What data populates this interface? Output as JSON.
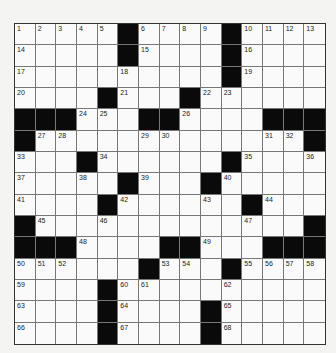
{
  "puzzle": {
    "rows": 15,
    "cols": 15,
    "colors": {
      "black": "#0a0a0a",
      "white": "#fafafa",
      "line": "#777777"
    },
    "grid": [
      "1,2,3,4,5,#,6,7,8,9,#,10,11,12,13",
      "14,.,.,.,.,#,15,.,.,.,#,16,.,.,.",
      "17,.,.,.,.,18,.,.,.,.,#,19,.,.,.",
      "20,.,.,.,#,21,.,.,#,22,23,.,.,.,.",
      "#,#,#,24,25,.,#,#,26,.,.,.,#,#,#",
      "#,27,28,.,.,.,29,30,.,.,.,.,31,32,#",
      "33,.,.,#,34,.,.,.,.,.,#,35,.,.,36",
      "37,.,.,38,.,#,39,.,.,#,40,.,.,.,.",
      "41,.,.,.,#,42,.,.,.,43,.,#,44,.,.",
      "#,45,.,.,46,.,.,.,.,.,.,47,.,.,#",
      "#,#,#,48,.,.,.,#,#,49,.,.,#,#,#",
      "50,51,52,.,.,.,#,53,54,.,#,55,56,57,58",
      "59,.,.,.,#,60,61,.,.,.,62,.,.,.,.",
      "63,.,.,.,#,64,.,.,.,#,65,.,.,.,.",
      "66,.,.,.,#,67,.,.,.,#,68,.,.,.,."
    ]
  }
}
